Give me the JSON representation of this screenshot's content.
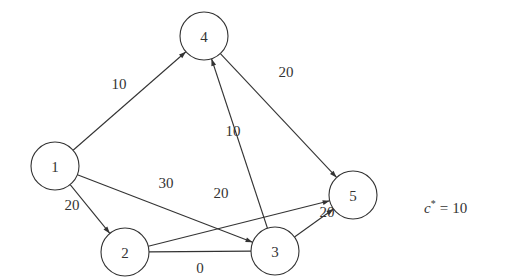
{
  "diagram": {
    "type": "directed-network",
    "nodes": [
      {
        "id": "1",
        "label": "1"
      },
      {
        "id": "2",
        "label": "2"
      },
      {
        "id": "3",
        "label": "3"
      },
      {
        "id": "4",
        "label": "4"
      },
      {
        "id": "5",
        "label": "5"
      }
    ],
    "edges": [
      {
        "from": "1",
        "to": "4",
        "label": "10",
        "directed": true
      },
      {
        "from": "4",
        "to": "5",
        "label": "20",
        "directed": true
      },
      {
        "from": "1",
        "to": "2",
        "label": "20",
        "directed": true
      },
      {
        "from": "1",
        "to": "3",
        "label": "30",
        "directed": true
      },
      {
        "from": "2",
        "to": "5",
        "label": "20",
        "directed": true
      },
      {
        "from": "3",
        "to": "4",
        "label": "10",
        "directed": true
      },
      {
        "from": "3",
        "to": "5",
        "label": "20",
        "directed": true
      },
      {
        "from": "2",
        "to": "3",
        "label": "0",
        "directed": false
      }
    ],
    "annotation": {
      "symbol": "c",
      "superscript": "*",
      "relation": "=",
      "value": "10"
    },
    "colors": {
      "stroke": "#333333",
      "background": "#ffffff"
    }
  }
}
